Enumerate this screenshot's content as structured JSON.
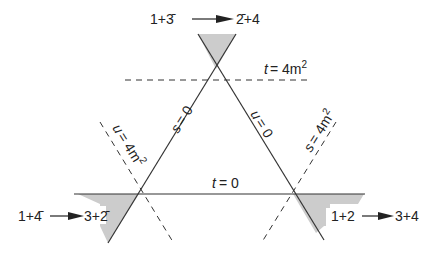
{
  "diagram": {
    "channels": {
      "s_channel": {
        "initial": "1+2",
        "final": "3+4"
      },
      "t_channel": {
        "initial": "1+3̄",
        "final": "2̄+4"
      },
      "u_channel": {
        "initial": "1+4̄",
        "final": "3+2̄"
      }
    },
    "lines": {
      "t_zero": {
        "var": "t",
        "eq": "= 0"
      },
      "s_zero": {
        "var": "s",
        "eq": "= 0"
      },
      "u_zero": {
        "var": "u",
        "eq": "= 0"
      },
      "t_threshold": {
        "var": "t",
        "eq": "= 4m",
        "sup": "2"
      },
      "s_threshold": {
        "var": "s",
        "eq": "= 4m",
        "sup": "2"
      },
      "u_threshold": {
        "var": "u",
        "eq": "= 4m",
        "sup": "2"
      }
    },
    "colors": {
      "line": "#333333",
      "shade": "#cccccc",
      "text": "#222222"
    }
  }
}
